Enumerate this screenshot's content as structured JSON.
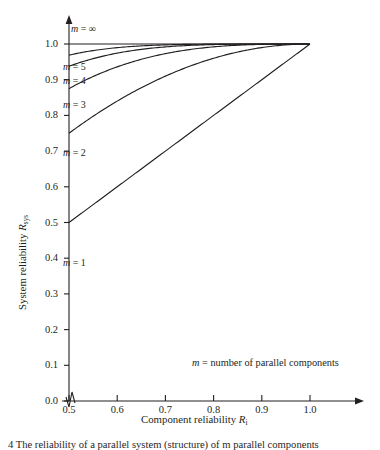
{
  "chart_data": {
    "type": "line",
    "title": "",
    "xlabel": "Component reliability R_i",
    "ylabel": "System reliability R_sys",
    "xlim": [
      0.5,
      1.0
    ],
    "ylim": [
      0.0,
      1.0
    ],
    "grid": false,
    "legend": "inline-curve-labels",
    "xticks": [
      "0.5",
      "0.6",
      "0.7",
      "0.8",
      "0.9",
      "1.0"
    ],
    "xtick_values": [
      0.5,
      0.6,
      0.7,
      0.8,
      0.9,
      1.0
    ],
    "yticks": [
      "0.0",
      "0.1",
      "0.2",
      "0.3",
      "0.4",
      "0.5",
      "0.6",
      "0.7",
      "0.8",
      "0.9",
      "1.0"
    ],
    "ytick_values": [
      0.0,
      0.1,
      0.2,
      0.3,
      0.4,
      0.5,
      0.6,
      0.7,
      0.8,
      0.9,
      1.0
    ],
    "axis_break_x": true,
    "x_axis_arrow": true,
    "y_axis_arrow": true,
    "annotation": "m = number of parallel components",
    "annotation_symbol": "m",
    "annotation_text": " = number of parallel components",
    "formula": "R_sys = 1 - (1 - R_i)^m",
    "x": [
      0.5,
      0.55,
      0.6,
      0.65,
      0.7,
      0.75,
      0.8,
      0.85,
      0.9,
      0.95,
      1.0
    ],
    "series": [
      {
        "name": "m = 1",
        "m": 1,
        "label": "m = 1",
        "values": [
          0.5,
          0.55,
          0.6,
          0.65,
          0.7,
          0.75,
          0.8,
          0.85,
          0.9,
          0.95,
          1.0
        ]
      },
      {
        "name": "m = 2",
        "m": 2,
        "label": "m = 2",
        "values": [
          0.75,
          0.798,
          0.84,
          0.878,
          0.91,
          0.938,
          0.96,
          0.978,
          0.99,
          0.998,
          1.0
        ]
      },
      {
        "name": "m = 3",
        "m": 3,
        "label": "m = 3",
        "values": [
          0.875,
          0.909,
          0.936,
          0.957,
          0.973,
          0.984,
          0.992,
          0.997,
          0.999,
          1.0,
          1.0
        ]
      },
      {
        "name": "m = 4",
        "m": 4,
        "label": "m = 4",
        "values": [
          0.938,
          0.959,
          0.974,
          0.985,
          0.992,
          0.996,
          0.998,
          1.0,
          1.0,
          1.0,
          1.0
        ]
      },
      {
        "name": "m = 5",
        "m": 5,
        "label": "m = 5",
        "values": [
          0.969,
          0.982,
          0.99,
          0.995,
          0.998,
          0.999,
          1.0,
          1.0,
          1.0,
          1.0,
          1.0
        ]
      },
      {
        "name": "m = infinity",
        "m": "∞",
        "label": "m = ∞",
        "values": [
          1.0,
          1.0,
          1.0,
          1.0,
          1.0,
          1.0,
          1.0,
          1.0,
          1.0,
          1.0,
          1.0
        ]
      }
    ],
    "curve_labels": [
      {
        "text": "m = ∞",
        "symbol": "m",
        "rest": " = ∞"
      },
      {
        "text": "m = 5",
        "symbol": "m",
        "rest": " = 5"
      },
      {
        "text": "m = 4",
        "symbol": "m",
        "rest": " = 4"
      },
      {
        "text": "m = 3",
        "symbol": "m",
        "rest": " = 3"
      },
      {
        "text": "m = 2",
        "symbol": "m",
        "rest": " = 2"
      },
      {
        "text": "m = 1",
        "symbol": "m",
        "rest": " = 1"
      }
    ],
    "colors": {
      "line": "#231f20",
      "axis": "#231f20",
      "text": "#231f20",
      "background": "#ffffff"
    }
  },
  "axis": {
    "x_label_main": "Component reliability ",
    "x_label_sym": "R",
    "x_label_sub": "i",
    "y_label_main": "System reliability ",
    "y_label_sym": "R",
    "y_label_sub": "sys"
  },
  "caption": {
    "text": "4   The reliability of a parallel system (structure) of m parallel components"
  }
}
